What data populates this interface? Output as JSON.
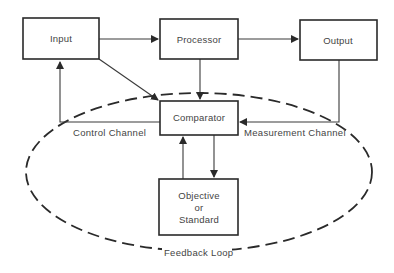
{
  "diagram": {
    "nodes": {
      "input": {
        "label": "Input"
      },
      "processor": {
        "label": "Processor"
      },
      "output": {
        "label": "Output"
      },
      "comparator": {
        "label": "Comparator"
      },
      "objective": {
        "line1": "Objective",
        "line2": "or",
        "line3": "Standard"
      }
    },
    "edges": {
      "control_channel": "Control Channel",
      "measurement_channel": "Measurement Channel",
      "feedback_loop": "Feedback Loop"
    },
    "colors": {
      "stroke": "#2a2a2a",
      "text": "#444444",
      "background": "#ffffff"
    }
  }
}
